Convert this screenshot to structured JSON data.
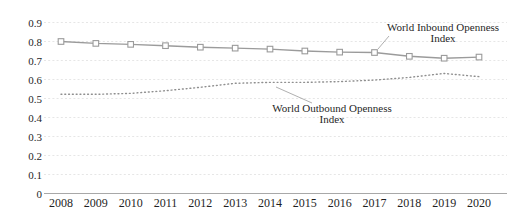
{
  "chart_data": {
    "type": "line",
    "title": "",
    "xlabel": "",
    "ylabel": "",
    "categories": [
      "2008",
      "2009",
      "2010",
      "2011",
      "2012",
      "2013",
      "2014",
      "2015",
      "2016",
      "2017",
      "2018",
      "2019",
      "2020"
    ],
    "series": [
      {
        "name": "World Inbound Openness Index",
        "style": "solid with open square markers",
        "color": "#9b9b9b",
        "values": [
          0.8,
          0.79,
          0.785,
          0.778,
          0.77,
          0.765,
          0.76,
          0.75,
          0.744,
          0.742,
          0.722,
          0.712,
          0.718
        ]
      },
      {
        "name": "World Outbound Openness Index",
        "style": "dotted",
        "color": "#8f8f8f",
        "values": [
          0.522,
          0.522,
          0.527,
          0.541,
          0.559,
          0.58,
          0.585,
          0.585,
          0.589,
          0.597,
          0.611,
          0.632,
          0.615
        ]
      }
    ],
    "ylim": [
      0,
      0.9
    ],
    "ytick_values": [
      0,
      0.1,
      0.2,
      0.3,
      0.4,
      0.5,
      0.6,
      0.7,
      0.8,
      0.9
    ],
    "ytick_labels": [
      "0",
      "0.1",
      "0.2",
      "0.3",
      "0.4",
      "0.5",
      "0.6",
      "0.7",
      "0.8",
      "0.9"
    ],
    "grid": true,
    "legend_position": "inline annotations with leader lines",
    "grid_color": "#e3e3e3",
    "axis_color": "#a8a8a8",
    "text_color": "#1f1f1f",
    "annotations": [
      {
        "line1": "World Inbound Openness",
        "line2": "Index",
        "target_year": "2017"
      },
      {
        "line1": "World Outbound Openness",
        "line2": "Index",
        "target_year": "2014"
      }
    ]
  }
}
